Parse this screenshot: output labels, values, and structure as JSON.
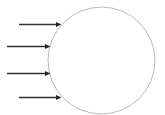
{
  "diagram": {
    "background": "#ffffff",
    "circle": {
      "cx": 101.5,
      "cy": 60.5,
      "r": 53.5,
      "stroke": "#b0b0b0",
      "stroke_width": 0.9,
      "fill": "none"
    },
    "arrow_style": {
      "stroke": "#333333",
      "stroke_width": 1.6,
      "head_color": "#222222"
    },
    "arrows": [
      {
        "id": "arrow-1",
        "x1": 19,
        "y1": 24.5,
        "x2": 60.5,
        "y2": 24.5
      },
      {
        "id": "arrow-2",
        "x1": 7,
        "y1": 46.5,
        "x2": 49.5,
        "y2": 46.5
      },
      {
        "id": "arrow-3",
        "x1": 7,
        "y1": 73.5,
        "x2": 49.5,
        "y2": 73.5
      },
      {
        "id": "arrow-4",
        "x1": 19,
        "y1": 97.5,
        "x2": 60.5,
        "y2": 97.5
      }
    ]
  }
}
